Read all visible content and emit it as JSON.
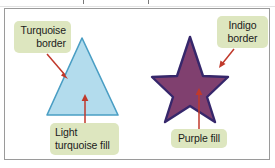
{
  "figure": {
    "background_color": "#ffffff",
    "frame_border_color": "#9a9a9a",
    "callout_background": "#dde6bf",
    "arrow_color": "#c0392b"
  },
  "shapes": [
    {
      "name": "triangle",
      "fill_label": "Light turquoise fill",
      "fill_color": "#b3dced",
      "border_label": "Turquoise border",
      "border_color": "#4a9ec4"
    },
    {
      "name": "star",
      "fill_label": "Purple fill",
      "fill_color": "#80406f",
      "border_label": "Indigo border",
      "border_color": "#36276b"
    }
  ],
  "callouts": {
    "turquoise_border": {
      "line1": "Turquoise",
      "line2": "border"
    },
    "indigo_border": {
      "line1": "Indigo",
      "line2": "border"
    },
    "light_turquoise_fill": {
      "line1": "Light",
      "line2": "turquoise fill"
    },
    "purple_fill": {
      "line1": "Purple fill"
    }
  }
}
